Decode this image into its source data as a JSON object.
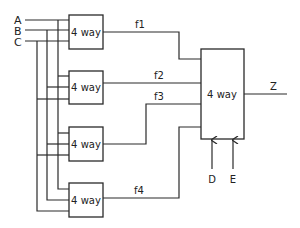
{
  "diagram": {
    "type": "multiplexer-tree",
    "colors": {
      "line": "#2a2a2a",
      "background": "#ffffff"
    },
    "inputs": [
      {
        "id": "A",
        "label": "A",
        "y": 20
      },
      {
        "id": "B",
        "label": "B",
        "y": 30
      },
      {
        "id": "C",
        "label": "C",
        "y": 41
      }
    ],
    "first_stage": [
      {
        "id": "mux1",
        "label": "4 way",
        "output": "f1"
      },
      {
        "id": "mux2",
        "label": "4 way",
        "output": "f2"
      },
      {
        "id": "mux3",
        "label": "4 way",
        "output": "f3"
      },
      {
        "id": "mux4",
        "label": "4 way",
        "output": "f4"
      }
    ],
    "signals": {
      "f1": "f1",
      "f2": "f2",
      "f3": "f3",
      "f4": "f4"
    },
    "second_stage": {
      "id": "mux5",
      "label": "4 way",
      "output": "Z"
    },
    "select_inputs": [
      {
        "id": "D",
        "label": "D"
      },
      {
        "id": "E",
        "label": "E"
      }
    ],
    "output_label": "Z"
  }
}
